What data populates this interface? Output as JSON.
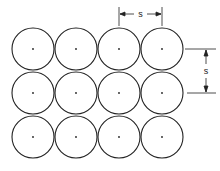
{
  "diagram": {
    "layout": "square",
    "rows": 3,
    "columns": 4,
    "pitch_label": "s",
    "stroke_color": "#222222",
    "background": "#ffffff",
    "circles": {
      "center_x": [
        33,
        76,
        119,
        162
      ],
      "center_y": [
        49,
        93,
        137
      ],
      "radius": 21
    },
    "dimensions": {
      "horizontal": {
        "label": "s",
        "from_x": 119,
        "to_x": 162,
        "y": 14
      },
      "vertical": {
        "label": "s",
        "from_y": 49,
        "to_y": 93,
        "x": 206
      }
    }
  }
}
